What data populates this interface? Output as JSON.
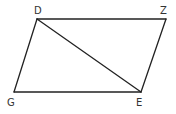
{
  "diagram": {
    "type": "parallelogram-with-diagonal",
    "vertices": [
      {
        "name": "D",
        "x": 37,
        "y": 19,
        "label_x": 34,
        "label_y": 14
      },
      {
        "name": "Z",
        "x": 166,
        "y": 19,
        "label_x": 160,
        "label_y": 14
      },
      {
        "name": "E",
        "x": 141,
        "y": 92,
        "label_x": 136,
        "label_y": 105
      },
      {
        "name": "G",
        "x": 14,
        "y": 92,
        "label_x": 7,
        "label_y": 105
      }
    ],
    "edges": [
      [
        "D",
        "Z"
      ],
      [
        "Z",
        "E"
      ],
      [
        "E",
        "G"
      ],
      [
        "G",
        "D"
      ],
      [
        "D",
        "E"
      ]
    ],
    "labels": {
      "D": "D",
      "Z": "Z",
      "E": "E",
      "G": "G"
    },
    "colors": {
      "line": "#222222",
      "text": "#333333",
      "background": "#ffffff"
    }
  }
}
